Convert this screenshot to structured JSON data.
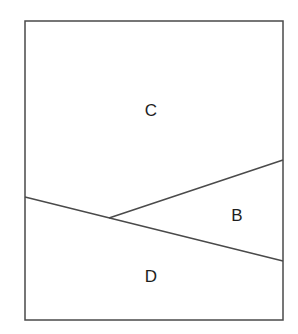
{
  "diagram": {
    "type": "region-partition",
    "canvas": {
      "width": 298,
      "height": 334,
      "background": "#ffffff"
    },
    "stroke_color": "#4a4a4a",
    "border": {
      "x": 25,
      "y": 21,
      "width": 258,
      "height": 299
    },
    "lines": [
      {
        "name": "lower-diagonal",
        "x1": 25,
        "y1": 197,
        "x2": 283,
        "y2": 261
      },
      {
        "name": "upper-diagonal",
        "x1": 109,
        "y1": 218,
        "x2": 283,
        "y2": 160
      }
    ],
    "regions": [
      {
        "id": "C",
        "label": "C",
        "x": 151,
        "y": 116
      },
      {
        "id": "B",
        "label": "B",
        "x": 237,
        "y": 221
      },
      {
        "id": "D",
        "label": "D",
        "x": 151,
        "y": 282
      }
    ]
  }
}
